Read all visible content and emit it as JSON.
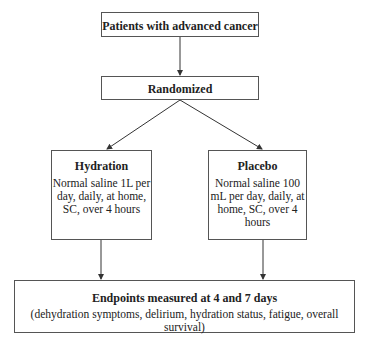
{
  "diagram": {
    "type": "flowchart",
    "nodes": {
      "population": {
        "label": "Patients with advanced cancer"
      },
      "randomization": {
        "label": "Randomized"
      },
      "hydration": {
        "title": "Hydration",
        "description": "Normal saline 1L per day, daily, at home, SC, over 4 hours"
      },
      "placebo": {
        "title": "Placebo",
        "description": "Normal saline 100 mL per day, daily, at home, SC, over 4 hours"
      },
      "endpoints": {
        "title": "Endpoints measured at 4 and 7 days",
        "description": "(dehydration symptoms, delirium, hydration status, fatigue, overall survival)"
      }
    },
    "edges": [
      {
        "from": "population",
        "to": "randomization"
      },
      {
        "from": "randomization",
        "to": "hydration"
      },
      {
        "from": "randomization",
        "to": "placebo"
      },
      {
        "from": "hydration",
        "to": "endpoints"
      },
      {
        "from": "placebo",
        "to": "endpoints"
      }
    ],
    "colors": {
      "border": "#555555",
      "arrow": "#333333",
      "text": "#222222",
      "background": "#ffffff"
    }
  }
}
